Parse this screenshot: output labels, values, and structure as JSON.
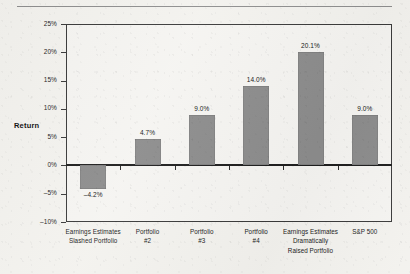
{
  "chart_data": {
    "type": "bar",
    "title": "",
    "xlabel": "",
    "ylabel": "Return",
    "ylim": [
      -10,
      25
    ],
    "ytick_labels": [
      "25%",
      "20%",
      "15%",
      "10%",
      "5%",
      "0%",
      "-5%",
      "-10%"
    ],
    "ytick_values": [
      25,
      20,
      15,
      10,
      5,
      0,
      -5,
      -10
    ],
    "grid": false,
    "legend": "none",
    "bar_color": "#8c8c8c",
    "categories": [
      "Earnings Estimates Slashed Portfolio",
      "Portfolio #2",
      "Portfolio #3",
      "Portfolio #4",
      "Earnings Estimates Dramatically Raised Portfolio",
      "S&P 500"
    ],
    "category_lines": [
      [
        "Earnings Estimates",
        "Slashed Portfolio"
      ],
      [
        "Portfolio",
        "#2"
      ],
      [
        "Portfolio",
        "#3"
      ],
      [
        "Portfolio",
        "#4"
      ],
      [
        "Earnings Estimates",
        "Dramatically",
        "Raised Portfolio"
      ],
      [
        "S&P 500"
      ]
    ],
    "values": [
      -4.2,
      4.7,
      9.0,
      14.0,
      20.1,
      9.0
    ],
    "value_labels": [
      "–4.2%",
      "4.7%",
      "9.0%",
      "14.0%",
      "20.1%",
      "9.0%"
    ]
  }
}
